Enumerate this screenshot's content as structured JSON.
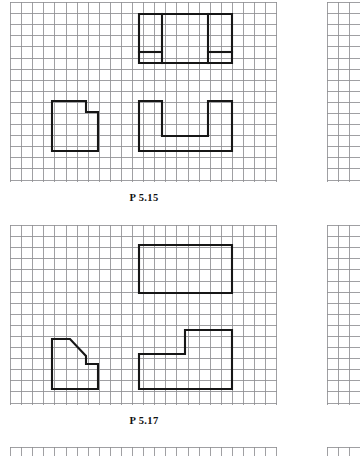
{
  "page": {
    "background_color": "#ffffff",
    "grid_line_color": "#8f8f93",
    "drawing_line_color": "#161616",
    "grid_cell_px": 11
  },
  "panels": [
    {
      "id": "panel-p515",
      "caption": "P 5.15",
      "grid": {
        "x": 10,
        "y": 2,
        "width": 267,
        "height": 180,
        "cell": 11.1
      },
      "caption_position": {
        "x": 96,
        "y": 192,
        "width": 96
      },
      "views": [
        {
          "name": "top-view",
          "description": "rectangle with two full-height vertical division lines and two short horizontal segments near the bottom",
          "outline": "M 139 14 L 232 14 L 232 63 L 139 63 Z",
          "inner": [
            "M 162 14 L 162 63",
            "M 208 14 L 208 63",
            "M 139 52 L 162 52",
            "M 208 52 L 232 52"
          ]
        },
        {
          "name": "front-view",
          "description": "U-shaped channel block with central rectangular slot open at the top",
          "outline": "M 139 101 L 162 101 L 162 136 L 208 136 L 208 101 L 232 101 L 232 151 L 139 151 Z",
          "inner": []
        },
        {
          "name": "side-view",
          "description": "rectangle with a small rectangular step notch cut from the top right corner",
          "outline": "M 52 101 L 86 101 L 86 112 L 98 112 L 98 151 L 52 151 Z",
          "inner": []
        }
      ]
    },
    {
      "id": "panel-p517",
      "caption": "P 5.17",
      "grid": {
        "x": 10,
        "y": 225,
        "width": 267,
        "height": 180,
        "cell": 11.1
      },
      "caption_position": {
        "x": 96,
        "y": 415,
        "width": 96
      },
      "views": [
        {
          "name": "top-view",
          "description": "plain rectangle with no internal lines",
          "outline": "M 139 245 L 232 245 L 232 293 L 139 293 Z",
          "inner": []
        },
        {
          "name": "front-view",
          "description": "L-shaped stepped block, lower left portion with raised right portion",
          "outline": "M 139 354 L 185 354 L 185 330 L 232 330 L 232 389 L 139 389 Z",
          "inner": []
        },
        {
          "name": "side-view",
          "description": "block with a diagonal chamfer at the top right and a step down to a lower right ledge",
          "outline": "M 52 339 L 70 339 L 86 356 L 86 364 L 98 364 L 98 389 L 52 389 Z",
          "inner": []
        }
      ]
    },
    {
      "id": "panel-next",
      "caption": "",
      "grid": {
        "x": 10,
        "y": 447,
        "width": 267,
        "height": 9,
        "cell": 11.1
      },
      "caption_position": {
        "x": 0,
        "y": 0,
        "width": 0
      },
      "views": []
    }
  ],
  "right_strips": [
    {
      "id": "right-strip-p515",
      "x": 327,
      "y": 2,
      "width": 33,
      "height": 180,
      "cell": 11.1
    },
    {
      "id": "right-strip-p517",
      "x": 327,
      "y": 225,
      "width": 33,
      "height": 180,
      "cell": 11.1
    },
    {
      "id": "right-strip-next",
      "x": 327,
      "y": 447,
      "width": 33,
      "height": 9,
      "cell": 11.1
    }
  ]
}
